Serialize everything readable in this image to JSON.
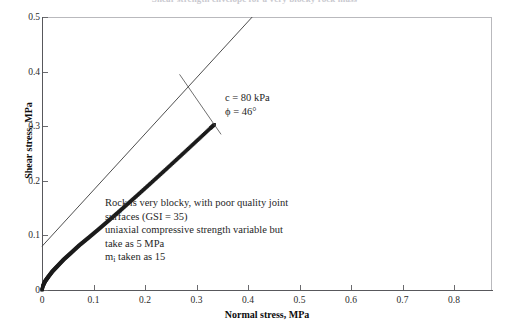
{
  "title_cut": "Shear strength envelope for a very blocky rock mass",
  "chart_data": {
    "type": "line",
    "title": "",
    "xlabel": "Normal stress, MPa",
    "ylabel": "Shear stress, MPa",
    "xlim": [
      0,
      0.867
    ],
    "ylim": [
      0,
      0.5
    ],
    "xticks": [
      "0",
      "0.1",
      "0.2",
      "0.3",
      "0.4",
      "0.5",
      "0.6",
      "0.7",
      "0.8"
    ],
    "xtick_values": [
      0,
      0.1,
      0.2,
      0.3,
      0.4,
      0.5,
      0.6,
      0.7,
      0.8
    ],
    "yticks": [
      "0",
      "0.1",
      "0.2",
      "0.3",
      "0.4",
      "0.5"
    ],
    "ytick_values": [
      0,
      0.1,
      0.2,
      0.3,
      0.4,
      0.5
    ],
    "grid": false,
    "legend": null,
    "series": [
      {
        "name": "Hoek-Brown envelope",
        "style": "marker-dense",
        "marker": "square",
        "color": "#1c1c1c",
        "x": [
          0.0,
          0.002,
          0.004,
          0.006,
          0.009,
          0.012,
          0.016,
          0.02,
          0.025,
          0.03,
          0.036,
          0.042,
          0.049,
          0.056,
          0.064,
          0.072,
          0.081,
          0.09,
          0.1,
          0.11,
          0.121,
          0.132,
          0.144,
          0.156,
          0.169,
          0.182,
          0.196,
          0.21,
          0.225,
          0.24,
          0.256,
          0.272,
          0.289,
          0.306,
          0.324,
          0.332
        ],
        "y": [
          0.0,
          0.008,
          0.012,
          0.016,
          0.02,
          0.024,
          0.029,
          0.034,
          0.039,
          0.044,
          0.05,
          0.056,
          0.062,
          0.068,
          0.075,
          0.082,
          0.089,
          0.096,
          0.104,
          0.112,
          0.121,
          0.13,
          0.14,
          0.15,
          0.161,
          0.172,
          0.184,
          0.196,
          0.209,
          0.222,
          0.236,
          0.25,
          0.265,
          0.28,
          0.296,
          0.303
        ]
      },
      {
        "name": "Mohr-Coulomb fit",
        "style": "line-thin",
        "color": "#3a3a3a",
        "x": [
          0.0,
          0.405
        ],
        "y": [
          0.08,
          0.5
        ]
      }
    ],
    "annotations": [
      {
        "name": "mohr-coulomb-parameters",
        "lines": [
          "c = 80 kPa",
          "ϕ = 46°"
        ],
        "leader_from": [
          0.345,
          0.285
        ],
        "leader_to": [
          0.265,
          0.395
        ]
      },
      {
        "name": "rock-mass-description",
        "lines": [
          "Rock is very blocky, with poor quality joint",
          "surfaces (GSI = 35)",
          "uniaxial compressive strength variable but",
          "take as 5 MPa"
        ],
        "last_line": {
          "prefix": "m",
          "subscript": "i",
          "suffix": " taken as 15"
        }
      }
    ]
  }
}
